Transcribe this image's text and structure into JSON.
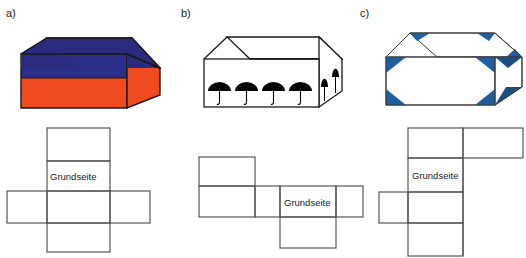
{
  "figures": [
    {
      "label": "a)",
      "solid": {
        "name": "cuboid-two-tone",
        "description": "Quader mit blauer oberer Haelfte und roter unterer Haelfte",
        "top_color": "#2b2b7f",
        "front_upper_color": "#2b2e86",
        "front_lower_color": "#f04b20",
        "side_color": "#f04b20",
        "outline_color": "#1a1a1a"
      },
      "net": {
        "name": "net-cross",
        "base_label": "Grundseite",
        "shape": "cross",
        "outline_color": "#555555"
      }
    },
    {
      "label": "b)",
      "solid": {
        "name": "cuboid-umbrellas",
        "description": "Quader mit Regenschirmen auf Vorderseite und Seitenflaeche",
        "face_color": "#ffffff",
        "umbrella_color": "#000000",
        "front_umbrella_count": 4,
        "side_umbrella_count": 2,
        "outline_color": "#1a1a1a"
      },
      "net": {
        "name": "net-stair",
        "base_label": "Grundseite",
        "shape": "stair",
        "outline_color": "#555555"
      }
    },
    {
      "label": "c)",
      "solid": {
        "name": "cuboid-blue-corners",
        "description": "Quader mit blauen Eckdreiecken auf den Flaechen",
        "face_color": "#ffffff",
        "corner_color": "#1f5fa0",
        "corner_color_dark": "#1a4e85",
        "outline_color": "#3a3a3a"
      },
      "net": {
        "name": "net-t-shape",
        "base_label": "Grundseite",
        "shape": "t-shape-clipped",
        "outline_color": "#555555"
      }
    }
  ],
  "colors": {
    "background": "#ffffff",
    "ink": "#1a1a1a",
    "net_line": "#555555",
    "blue": "#2b2e86",
    "red": "#f04b20",
    "corner_blue": "#1f5fa0"
  }
}
